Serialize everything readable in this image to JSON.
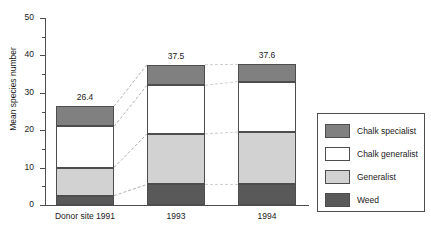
{
  "chart_data": {
    "type": "bar",
    "subtype": "stacked",
    "title": "",
    "xlabel": "",
    "ylabel": "Mean species number",
    "ylim": [
      0,
      50
    ],
    "grid": false,
    "legend_position": "right",
    "categories": [
      "Donor site 1991",
      "1993",
      "1994"
    ],
    "totals": [
      26.4,
      37.5,
      37.6
    ],
    "total_labels": [
      "26.4",
      "37.5",
      "37.6"
    ],
    "y_ticks_major": [
      0,
      10,
      20,
      30,
      40,
      50
    ],
    "y_tick_labels": [
      "0",
      "10",
      "20",
      "30",
      "40",
      "50"
    ],
    "y_ticks_minor": [
      5,
      15,
      25,
      35,
      45
    ],
    "series": [
      {
        "name": "Weed",
        "color": "#595959",
        "values": [
          2.5,
          5.5,
          5.5
        ]
      },
      {
        "name": "Generalist",
        "color": "#d2d2d2",
        "values": [
          7.5,
          13.5,
          14.0
        ]
      },
      {
        "name": "Chalk generalist",
        "color": "#ffffff",
        "values": [
          11.0,
          13.0,
          13.5
        ]
      },
      {
        "name": "Chalk specialist",
        "color": "#808080",
        "values": [
          5.4,
          5.5,
          4.6
        ]
      }
    ],
    "annotations": [
      "Dashed lines connect corresponding stack boundaries between adjacent bars."
    ]
  },
  "legend": {
    "items": [
      {
        "label": "Chalk specialist",
        "color": "#808080"
      },
      {
        "label": "Chalk generalist",
        "color": "#ffffff"
      },
      {
        "label": "Generalist",
        "color": "#d2d2d2"
      },
      {
        "label": "Weed",
        "color": "#595959"
      }
    ]
  },
  "axis": {
    "y_title": "Mean species number"
  }
}
